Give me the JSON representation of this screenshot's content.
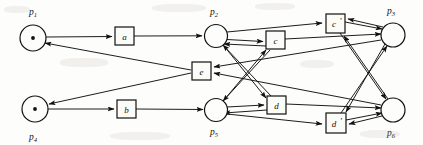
{
  "figure": {
    "kind": "petri-net",
    "background_color": "#fdfdfb",
    "ink_color": "#111111",
    "width": 423,
    "height": 145
  },
  "places": [
    {
      "id": "p1",
      "label": "p",
      "subscript": "1",
      "cx": 33,
      "cy": 38,
      "r": 13,
      "tokens": 1,
      "label_x": 29,
      "label_y": 15,
      "label_pos": "above"
    },
    {
      "id": "p2",
      "label": "p",
      "subscript": "2",
      "cx": 216,
      "cy": 36,
      "r": 11.5,
      "tokens": 0,
      "label_x": 211,
      "label_y": 15,
      "label_pos": "above"
    },
    {
      "id": "p3",
      "label": "p",
      "subscript": "3",
      "cx": 393,
      "cy": 35,
      "r": 12,
      "tokens": 0,
      "label_x": 388,
      "label_y": 14,
      "label_pos": "above"
    },
    {
      "id": "p4",
      "label": "p",
      "subscript": "4",
      "cx": 35,
      "cy": 109,
      "r": 13,
      "tokens": 1,
      "label_x": 30,
      "label_y": 140,
      "label_pos": "below"
    },
    {
      "id": "p5",
      "label": "p",
      "subscript": "5",
      "cx": 216,
      "cy": 110,
      "r": 11.5,
      "tokens": 0,
      "label_x": 211,
      "label_y": 135,
      "label_pos": "below"
    },
    {
      "id": "p6",
      "label": "p",
      "subscript": "6",
      "cx": 393,
      "cy": 110,
      "r": 12,
      "tokens": 0,
      "label_x": 388,
      "label_y": 136,
      "label_pos": "below"
    }
  ],
  "transitions": [
    {
      "id": "a",
      "label": "a",
      "prime": false,
      "x": 115,
      "y": 27,
      "w": 19,
      "h": 18
    },
    {
      "id": "b",
      "label": "b",
      "prime": false,
      "x": 117,
      "y": 100,
      "w": 19,
      "h": 18
    },
    {
      "id": "c",
      "label": "c",
      "prime": false,
      "x": 266,
      "y": 31,
      "w": 19,
      "h": 18
    },
    {
      "id": "cp",
      "label": "c",
      "prime": true,
      "x": 326,
      "y": 14,
      "w": 19,
      "h": 19
    },
    {
      "id": "d",
      "label": "d",
      "prime": false,
      "x": 267,
      "y": 96,
      "w": 19,
      "h": 18
    },
    {
      "id": "dp",
      "label": "d",
      "prime": true,
      "x": 326,
      "y": 113,
      "w": 20,
      "h": 20
    },
    {
      "id": "e",
      "label": "e",
      "prime": false,
      "x": 192,
      "y": 62,
      "w": 19,
      "h": 18
    }
  ],
  "arcs": [
    {
      "from": "p1",
      "to": "a",
      "note": "p1 to transition a"
    },
    {
      "from": "a",
      "to": "p2",
      "note": "transition a to p2"
    },
    {
      "from": "p4",
      "to": "b",
      "note": "p4 to transition b"
    },
    {
      "from": "b",
      "to": "p5",
      "note": "transition b to p5"
    },
    {
      "from": "e",
      "to": "p1",
      "note": "transition e back to p1"
    },
    {
      "from": "e",
      "to": "p4",
      "note": "transition e back to p4"
    },
    {
      "from": "p2",
      "to": "c",
      "note": "p2 to c"
    },
    {
      "from": "p2",
      "to": "cp",
      "note": "p2 to c prime"
    },
    {
      "from": "p2",
      "to": "d",
      "note": "p2 to d (crossing)"
    },
    {
      "from": "p5",
      "to": "d",
      "note": "p5 to d"
    },
    {
      "from": "p5",
      "to": "c",
      "note": "p5 to c (crossing)"
    },
    {
      "from": "p5",
      "to": "dp",
      "note": "p5 to d prime"
    },
    {
      "from": "c",
      "to": "p2",
      "note": "c back to p2"
    },
    {
      "from": "c",
      "to": "p5",
      "note": "c back to p5"
    },
    {
      "from": "c",
      "to": "p3",
      "note": "c to p3"
    },
    {
      "from": "d",
      "to": "p2",
      "note": "d back to p2"
    },
    {
      "from": "d",
      "to": "p5",
      "note": "d back to p5"
    },
    {
      "from": "d",
      "to": "p6",
      "note": "d to p6"
    },
    {
      "from": "cp",
      "to": "p3",
      "note": "c prime to p3"
    },
    {
      "from": "cp",
      "to": "p6",
      "note": "c prime to p6 (crossing)"
    },
    {
      "from": "dp",
      "to": "p6",
      "note": "d prime to p6"
    },
    {
      "from": "dp",
      "to": "p3",
      "note": "d prime to p3 (crossing)"
    },
    {
      "from": "p3",
      "to": "cp",
      "note": "p3 to c prime"
    },
    {
      "from": "p3",
      "to": "dp",
      "note": "p3 to d prime (crossing)"
    },
    {
      "from": "p6",
      "to": "dp",
      "note": "p6 to d prime"
    },
    {
      "from": "p6",
      "to": "cp",
      "note": "p6 to c prime (crossing)"
    },
    {
      "from": "p3",
      "to": "e",
      "note": "p3 to transition e"
    },
    {
      "from": "p6",
      "to": "e",
      "note": "p6 to transition e"
    }
  ]
}
